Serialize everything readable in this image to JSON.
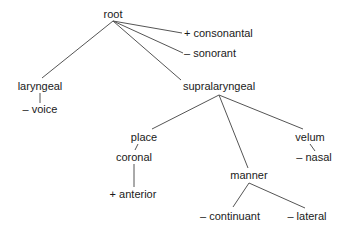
{
  "diagram": {
    "type": "feature-geometry-tree",
    "colors": {
      "edge": "#555555",
      "text": "#1a1a1a",
      "background": "#ffffff"
    },
    "nodes": {
      "root": {
        "label": "root"
      },
      "consonantal": {
        "label": "+ consonantal"
      },
      "sonorant": {
        "label": "– sonorant"
      },
      "laryngeal": {
        "label": "laryngeal"
      },
      "voice": {
        "label": "– voice"
      },
      "supralaryngeal": {
        "label": "supralaryngeal"
      },
      "place": {
        "label": "place"
      },
      "coronal": {
        "label": "coronal"
      },
      "anterior": {
        "label": "+ anterior"
      },
      "manner": {
        "label": "manner"
      },
      "velum": {
        "label": "velum"
      },
      "nasal": {
        "label": "– nasal"
      },
      "continuant": {
        "label": "– continuant"
      },
      "lateral": {
        "label": "– lateral"
      }
    },
    "edges": [
      {
        "from": "root",
        "to": "consonantal"
      },
      {
        "from": "root",
        "to": "sonorant"
      },
      {
        "from": "root",
        "to": "laryngeal"
      },
      {
        "from": "root",
        "to": "supralaryngeal"
      },
      {
        "from": "laryngeal",
        "to": "voice"
      },
      {
        "from": "supralaryngeal",
        "to": "place"
      },
      {
        "from": "supralaryngeal",
        "to": "manner"
      },
      {
        "from": "supralaryngeal",
        "to": "velum"
      },
      {
        "from": "place",
        "to": "coronal"
      },
      {
        "from": "coronal",
        "to": "anterior"
      },
      {
        "from": "velum",
        "to": "nasal"
      },
      {
        "from": "manner",
        "to": "continuant"
      },
      {
        "from": "manner",
        "to": "lateral"
      }
    ]
  }
}
